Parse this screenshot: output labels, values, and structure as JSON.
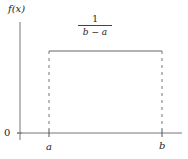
{
  "diagram": {
    "type": "uniform-distribution-pdf",
    "y_axis_label": "f(x)",
    "origin_label": "0",
    "x_tick_labels": [
      "a",
      "b"
    ],
    "height_label": {
      "numerator": "1",
      "denominator": "b − a"
    }
  }
}
